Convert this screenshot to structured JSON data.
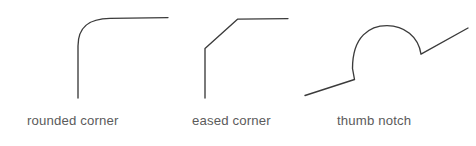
{
  "figure": {
    "background_color": "#ffffff",
    "stroke_color": "#3b3b3b",
    "label_color": "#5b5b5b",
    "width": 476,
    "height": 146,
    "items": [
      {
        "id": "rounded-corner",
        "label": "rounded corner",
        "description": "vertical edge blending through a smooth quarter-round arc into a horizontal edge",
        "path": "M 78 98 L 78 46 C 78 26 90 18.6 110 18.4 L 168 17.6"
      },
      {
        "id": "eased-corner",
        "label": "eased corner",
        "description": "vertical edge meeting a straight chamfer that meets a horizontal edge",
        "path": "M 205 98 L 205 48.5 L 237.5 19.2 L 288 18.6"
      },
      {
        "id": "thumb-notch",
        "label": "thumb notch",
        "description": "inclined edge rising into a semicircular scallop, breaking at a notch and continuing upward",
        "path": "M 305 95.5 L 354.5 79.5 L 352.5 68.5 C 352.5 36 370 25.6 387 25.6 C 404 25.6 418.5 36.5 421 54.2 L 468 28"
      }
    ]
  }
}
